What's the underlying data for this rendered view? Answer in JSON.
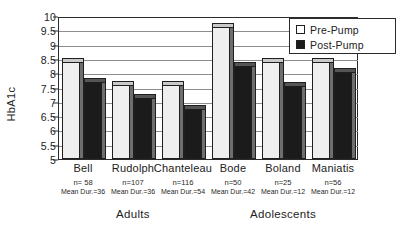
{
  "chart_data": {
    "type": "bar",
    "title": "",
    "xlabel": "",
    "ylabel": "HbA1c",
    "ylim": [
      5,
      10
    ],
    "ytick_step": 0.5,
    "yticks": [
      "10",
      "9.5",
      "9",
      "8.5",
      "8",
      "7.5",
      "7",
      "6.5",
      "6",
      "5.5",
      "5"
    ],
    "grid": true,
    "legend_position": "top-right",
    "categories": [
      "Bell",
      "Rudolph",
      "Chanteleau",
      "Bode",
      "Boland",
      "Maniatis"
    ],
    "series": [
      {
        "name": "Pre-Pump",
        "values": [
          8.4,
          7.6,
          7.6,
          9.6,
          8.4,
          8.4
        ]
      },
      {
        "name": "Post-Pump",
        "values": [
          7.7,
          7.15,
          6.75,
          8.25,
          7.55,
          8.05
        ]
      }
    ],
    "annotations": {
      "n_label_prefix": "n=",
      "n_values": [
        "n= 58",
        "n=107",
        "n=116",
        "n=50",
        "n=25",
        "n=56"
      ],
      "duration_values": [
        "Mean Dur.=36",
        "Mean Dur.=36",
        "Mean Dur.=54",
        "Mean Dur.=42",
        "Mean Dur.=12",
        "Mean Dur.=12"
      ],
      "super_groups": [
        {
          "label": "Adults",
          "categories": [
            "Bell",
            "Rudolph",
            "Chanteleau"
          ]
        },
        {
          "label": "Adolescents",
          "categories": [
            "Bode",
            "Boland",
            "Maniatis"
          ]
        }
      ]
    },
    "colors": {
      "pre_pump_fill": "#efefef",
      "post_pump_fill": "#1b1b1b",
      "axis": "#2b2b2b",
      "gridline": "#8d8d8d",
      "background": "#ffffff"
    }
  },
  "legend": {
    "items": [
      {
        "label": "Pre-Pump",
        "swatch": "pre"
      },
      {
        "label": "Post-Pump",
        "swatch": "post"
      }
    ]
  }
}
